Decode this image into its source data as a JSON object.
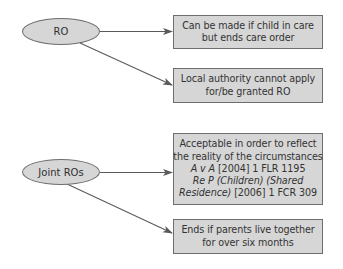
{
  "diagram": {
    "colors": {
      "background": "#ffffff",
      "node_fill": "#d6d6d6",
      "node_border": "#6e6e6e",
      "edge": "#5a5a5a",
      "text": "#333333"
    },
    "sources": [
      {
        "id": "ro",
        "label": "RO"
      },
      {
        "id": "joint_ros",
        "label": "Joint ROs"
      }
    ],
    "boxes": [
      {
        "id": "box1",
        "from": "ro",
        "lines": [
          "Can be made if child in care",
          "but ends care order"
        ]
      },
      {
        "id": "box2",
        "from": "ro",
        "lines": [
          "Local authority cannot apply",
          "for/be granted RO"
        ]
      },
      {
        "id": "box3",
        "from": "joint_ros",
        "lines": [
          "Acceptable in order to reflect",
          "the reality of the circumstances"
        ],
        "case1": {
          "italic": "A v A",
          "citation": " [2004] 1 FLR 1195"
        },
        "case2": {
          "italic_line1": "Re P (Children) (Shared",
          "italic_line2": "Residence)",
          "citation": " [2006] 1 FCR 309"
        }
      },
      {
        "id": "box4",
        "from": "joint_ros",
        "lines": [
          "Ends if parents live together",
          "for over six months"
        ]
      }
    ]
  }
}
